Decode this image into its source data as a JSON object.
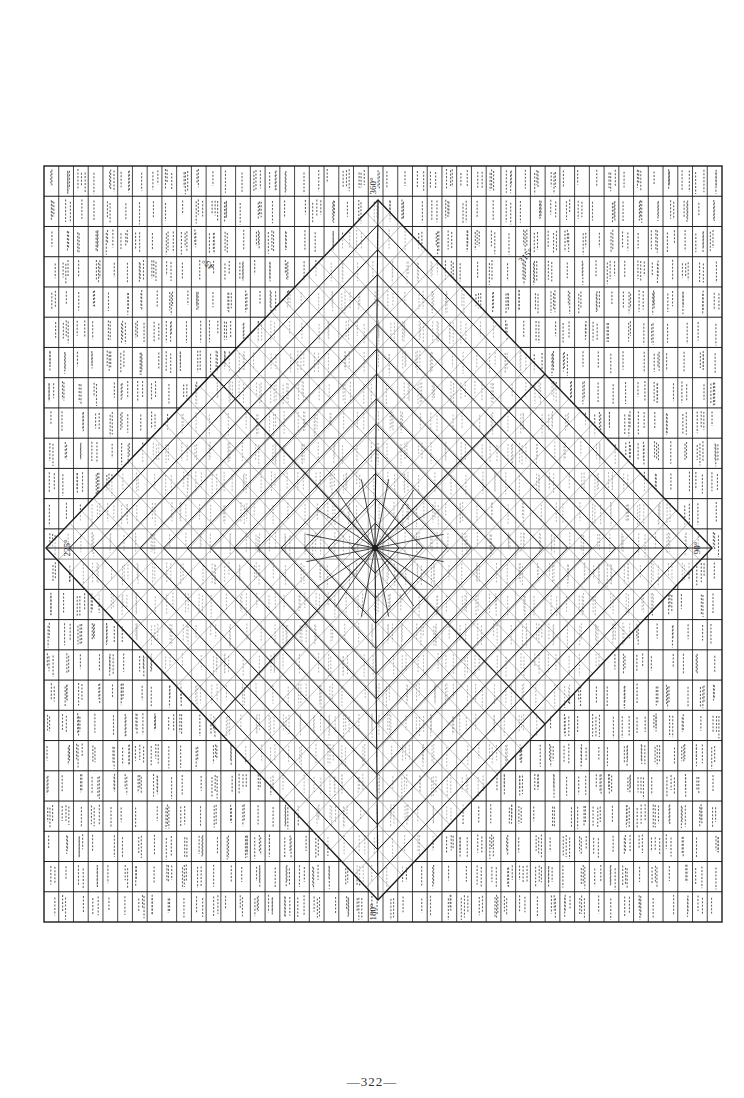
{
  "page": {
    "footer_page_number": "—322—"
  },
  "chart_data": {
    "type": "table",
    "title": "",
    "grid": {
      "left": 44,
      "top": 166,
      "right": 722,
      "bottom": 922,
      "cols": 46,
      "rows": 25
    },
    "center": {
      "x": 375,
      "y": 548
    },
    "diamond": {
      "top": [
        378,
        200
      ],
      "right": [
        712,
        548
      ],
      "bottom": [
        378,
        900
      ],
      "left": [
        46,
        548
      ]
    },
    "inner_diamond_rings": 14,
    "radial_angles_deg": [
      0,
      45,
      90,
      135,
      180,
      225,
      270,
      315
    ],
    "degree_markers": [
      {
        "label": "360°",
        "x": 376,
        "y": 186,
        "rot": -90
      },
      {
        "label": "315°",
        "x": 528,
        "y": 258,
        "rot": -45
      },
      {
        "label": "45°",
        "x": 210,
        "y": 262,
        "rot": -135
      },
      {
        "label": "180°",
        "x": 376,
        "y": 912,
        "rot": -90
      },
      {
        "label": "225°",
        "x": 70,
        "y": 548,
        "rot": -90
      },
      {
        "label": "90°",
        "x": 700,
        "y": 548,
        "rot": -90
      }
    ],
    "center_value": "1",
    "note": "Individual cell numbers (approx. 1 through ~1450) are too degraded in the scan to transcribe reliably."
  },
  "colors": {
    "ink": "#1c1c1c",
    "paper": "#ffffff",
    "faint_ink": "#6a6a6a"
  }
}
